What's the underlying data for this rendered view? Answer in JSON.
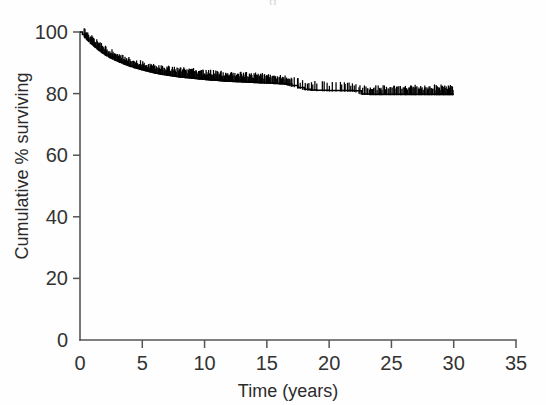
{
  "figure": {
    "background_color": "#fefefe",
    "ink_color": "#000000",
    "cropped_header_text": "g"
  },
  "chart_data": {
    "type": "line",
    "subtype": "kaplan-meier-survival-step",
    "title": "",
    "xlabel": "Time (years)",
    "ylabel": "Cumulative % surviving",
    "xlim": [
      0,
      35
    ],
    "ylim": [
      0,
      100
    ],
    "xticks": [
      0,
      5,
      10,
      15,
      20,
      25,
      30,
      35
    ],
    "xticklabels": [
      "0",
      "5",
      "10",
      "15",
      "20",
      "25",
      "30",
      "35"
    ],
    "yticks": [
      0,
      20,
      40,
      60,
      80,
      100
    ],
    "yticklabels": [
      "0",
      "20",
      "40",
      "60",
      "80",
      "100"
    ],
    "grid": false,
    "legend": null,
    "legend_position": "none",
    "annotations": [],
    "series": [
      {
        "name": "Cumulative survival",
        "color": "#000000",
        "style": "step-post",
        "x_end": 30,
        "y_start": 100,
        "y_end": 79.8,
        "x": [
          0.0,
          0.2,
          0.4,
          0.6,
          0.9,
          1.2,
          1.5,
          1.8,
          2.1,
          2.4,
          2.8,
          3.2,
          3.6,
          4.0,
          4.4,
          4.8,
          5.2,
          5.6,
          6.0,
          6.5,
          7.0,
          7.5,
          8.0,
          8.5,
          9.0,
          9.5,
          10.0,
          10.5,
          11.0,
          11.5,
          12.0,
          12.5,
          13.0,
          13.5,
          14.0,
          14.5,
          15.0,
          15.5,
          16.0,
          16.5,
          17.0,
          17.5,
          18.0,
          18.5,
          19.0,
          20.0,
          21.0,
          22.0,
          22.6,
          23.5,
          25.0,
          27.0,
          28.5,
          30.0
        ],
        "y": [
          100.0,
          99.2,
          98.3,
          97.4,
          96.3,
          95.2,
          94.2,
          93.3,
          92.5,
          91.8,
          91.0,
          90.3,
          89.6,
          89.0,
          88.5,
          88.0,
          87.6,
          87.2,
          86.8,
          86.4,
          86.1,
          85.8,
          85.5,
          85.3,
          85.1,
          84.9,
          84.7,
          84.5,
          84.4,
          84.2,
          84.1,
          84.0,
          83.9,
          83.8,
          83.7,
          83.6,
          83.5,
          83.4,
          83.3,
          83.1,
          82.6,
          82.0,
          81.4,
          81.2,
          81.1,
          81.0,
          81.0,
          80.9,
          79.9,
          79.8,
          79.8,
          79.8,
          79.8,
          79.8
        ],
        "censoring_marks_visible": true,
        "censoring_mark_note": "Dense vertical tick marks drawn above the step curve across the entire follow-up period"
      }
    ]
  },
  "axes": {
    "x_axis_name": "Time (years)",
    "y_axis_name": "Cumulative % surviving"
  }
}
